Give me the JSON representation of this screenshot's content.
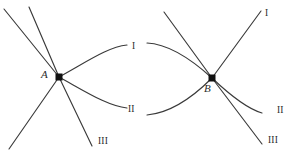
{
  "figure": {
    "type": "phase-diagram-branch-sketch",
    "background_color": "#ffffff",
    "stroke_color": "#3a3a3a",
    "node_color": "#111111",
    "label_color": "#2b2b2b",
    "nodes": [
      {
        "id": "A",
        "label": "A",
        "x": 59,
        "y": 77
      },
      {
        "id": "B",
        "label": "B",
        "x": 212,
        "y": 78
      }
    ],
    "branch_labels_left": [
      {
        "id": "left-I",
        "label": "I",
        "x": 132,
        "y": 42
      },
      {
        "id": "left-II",
        "label": "II",
        "x": 128,
        "y": 105
      },
      {
        "id": "left-III",
        "label": "III",
        "x": 98,
        "y": 137
      }
    ],
    "branch_labels_right": [
      {
        "id": "right-I",
        "label": "I",
        "x": 265,
        "y": 9
      },
      {
        "id": "right-II",
        "label": "II",
        "x": 277,
        "y": 106
      },
      {
        "id": "right-III",
        "label": "III",
        "x": 268,
        "y": 136
      }
    ],
    "paths": {
      "left_ray_upper_far": "M 4 9 L 59 77",
      "left_ray_upper_near": "M 29 7 L 59 77",
      "left_ray_lower_far": "M 59 77 L 9 149",
      "left_ray_lower_III": "M 59 77 L 92 146",
      "left_curve_I": "M 59 77 C 88 61 108 47 127 45",
      "left_curve_II": "M 59 77 C 88 93 108 106 127 108",
      "right_curve_I_in": "M 147 43 C 168 44 190 58 212 78",
      "right_ray_up_left": "M 212 78 L 164 12",
      "right_ray_up_I": "M 212 78 L 261 11",
      "right_curve_II_in": "M 147 115 C 170 113 192 98 212 78",
      "right_curve_II_out": "M 212 78 C 232 97 248 109 262 113",
      "right_ray_III": "M 212 78 L 262 144"
    }
  }
}
